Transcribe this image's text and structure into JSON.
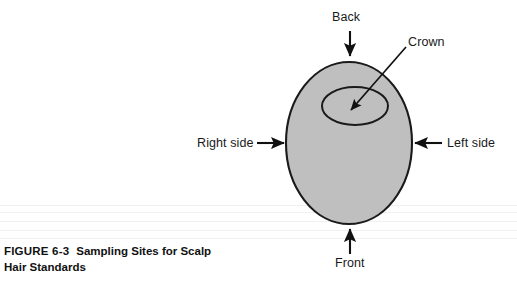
{
  "figure": {
    "caption_number": "FIGURE 6-3",
    "caption_title": "Sampling Sites for Scalp",
    "caption_line2": "Hair Standards"
  },
  "diagram": {
    "type": "scalp-sampling-sites",
    "head_outline": {
      "shape": "ellipse",
      "fill_color": "#bfbfbf",
      "stroke_color": "#1a1a1a",
      "cx": 349,
      "cy": 143,
      "rx": 63,
      "ry": 81
    },
    "crown_region": {
      "shape": "ellipse",
      "fill_color": "none",
      "stroke_color": "#1a1a1a",
      "cx": 355,
      "cy": 106,
      "rx": 33,
      "ry": 19
    },
    "labels": [
      {
        "id": "back",
        "text": "Back",
        "arrow_direction": "down"
      },
      {
        "id": "crown",
        "text": "Crown",
        "arrow_direction": "down-left"
      },
      {
        "id": "right_side",
        "text": "Right side",
        "arrow_direction": "right"
      },
      {
        "id": "left_side",
        "text": "Left side",
        "arrow_direction": "left"
      },
      {
        "id": "front",
        "text": "Front",
        "arrow_direction": "up"
      }
    ]
  }
}
